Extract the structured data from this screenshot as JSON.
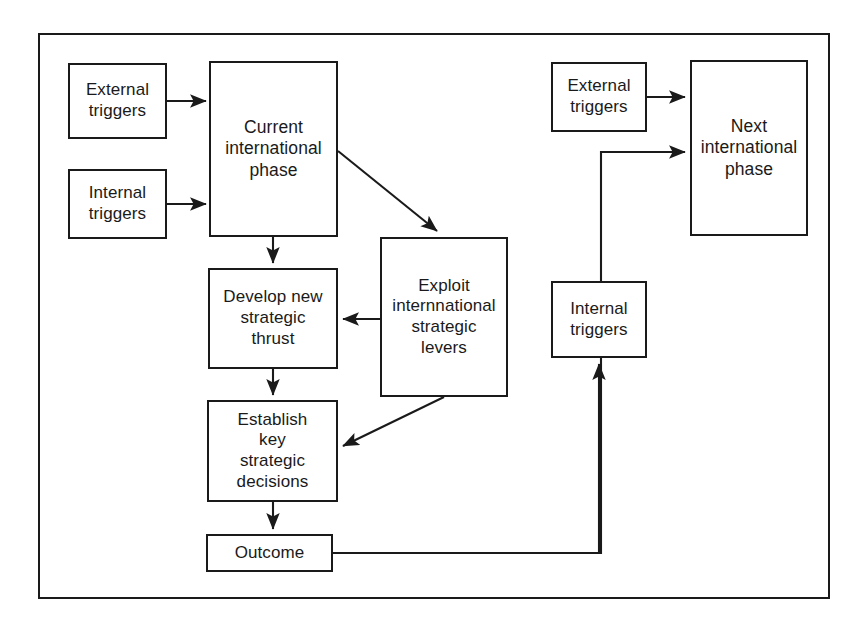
{
  "figure": {
    "frame": {
      "stroke_color": "#1a1a1a"
    }
  },
  "nodes": [
    {
      "id": "external-triggers-left",
      "label": "External\ntriggers",
      "x": 68,
      "y": 63,
      "w": 99,
      "h": 76,
      "size": "sz-md"
    },
    {
      "id": "internal-triggers-left",
      "label": "Internal\ntriggers",
      "x": 68,
      "y": 169,
      "w": 99,
      "h": 70,
      "size": "sz-md"
    },
    {
      "id": "current-international-phase",
      "label": "Current\ninternational\nphase",
      "x": 209,
      "y": 61,
      "w": 129,
      "h": 176,
      "size": "sz-lg"
    },
    {
      "id": "develop-new-strategic-thrust",
      "label": "Develop new\nstrategic\nthrust",
      "x": 208,
      "y": 268,
      "w": 130,
      "h": 101,
      "size": "sz-md"
    },
    {
      "id": "exploit-international-strategic-levers",
      "label": "Exploit\ninternnational\nstrategic\nlevers",
      "x": 380,
      "y": 237,
      "w": 128,
      "h": 160,
      "size": "sz-md"
    },
    {
      "id": "establish-key-strategic-decisions",
      "label": "Establish\nkey\nstrategic\ndecisions",
      "x": 207,
      "y": 400,
      "w": 131,
      "h": 102,
      "size": "sz-md"
    },
    {
      "id": "outcome",
      "label": "Outcome",
      "x": 206,
      "y": 534,
      "w": 127,
      "h": 38,
      "size": "sz-md"
    },
    {
      "id": "external-triggers-right",
      "label": "External\ntriggers",
      "x": 551,
      "y": 62,
      "w": 96,
      "h": 70,
      "size": "sz-md"
    },
    {
      "id": "internal-triggers-right",
      "label": "Internal\ntriggers",
      "x": 551,
      "y": 281,
      "w": 96,
      "h": 77,
      "size": "sz-md"
    },
    {
      "id": "next-international-phase",
      "label": "Next\ninternational\nphase",
      "x": 690,
      "y": 60,
      "w": 118,
      "h": 176,
      "size": "sz-lg"
    }
  ],
  "connectors": [
    {
      "id": "external-triggers-left-to-current-phase",
      "from": "external-triggers-left",
      "to": "current-international-phase",
      "path": "M 167 101 L 206 101",
      "arrow": true
    },
    {
      "id": "internal-triggers-left-to-current-phase",
      "from": "internal-triggers-left",
      "to": "current-international-phase",
      "path": "M 167 204 L 206 204",
      "arrow": true
    },
    {
      "id": "current-phase-to-develop-thrust",
      "from": "current-international-phase",
      "to": "develop-new-strategic-thrust",
      "path": "M 273 237 L 273 263",
      "arrow": true
    },
    {
      "id": "current-phase-to-exploit-levers",
      "from": "current-international-phase",
      "to": "exploit-international-strategic-levers",
      "path": "M 338 151 L 437 231",
      "arrow": true
    },
    {
      "id": "exploit-levers-to-develop-thrust",
      "from": "exploit-international-strategic-levers",
      "to": "develop-new-strategic-thrust",
      "path": "M 380 319 L 343 319",
      "arrow": true
    },
    {
      "id": "develop-thrust-to-establish-decisions",
      "from": "develop-new-strategic-thrust",
      "to": "establish-key-strategic-decisions",
      "path": "M 273 369 L 273 395",
      "arrow": true
    },
    {
      "id": "exploit-levers-to-establish-decisions",
      "from": "exploit-international-strategic-levers",
      "to": "establish-key-strategic-decisions",
      "path": "M 444 397 L 343 446",
      "arrow": true
    },
    {
      "id": "establish-decisions-to-outcome",
      "from": "establish-key-strategic-decisions",
      "to": "outcome",
      "path": "M 273 502 L 273 529",
      "arrow": true
    },
    {
      "id": "outcome-to-next-phase",
      "from": "outcome",
      "to": "next-international-phase",
      "path": "M 333 553 L 601 553 L 601 152 L 685 152",
      "arrow": true
    },
    {
      "id": "outcome-branch-to-internal-triggers-right",
      "from": "outcome",
      "to": "internal-triggers-right",
      "path": "M 599 553 L 599 364",
      "arrow": true
    },
    {
      "id": "external-triggers-right-to-next-phase",
      "from": "external-triggers-right",
      "to": "next-international-phase",
      "path": "M 647 97 L 685 97",
      "arrow": true
    }
  ]
}
